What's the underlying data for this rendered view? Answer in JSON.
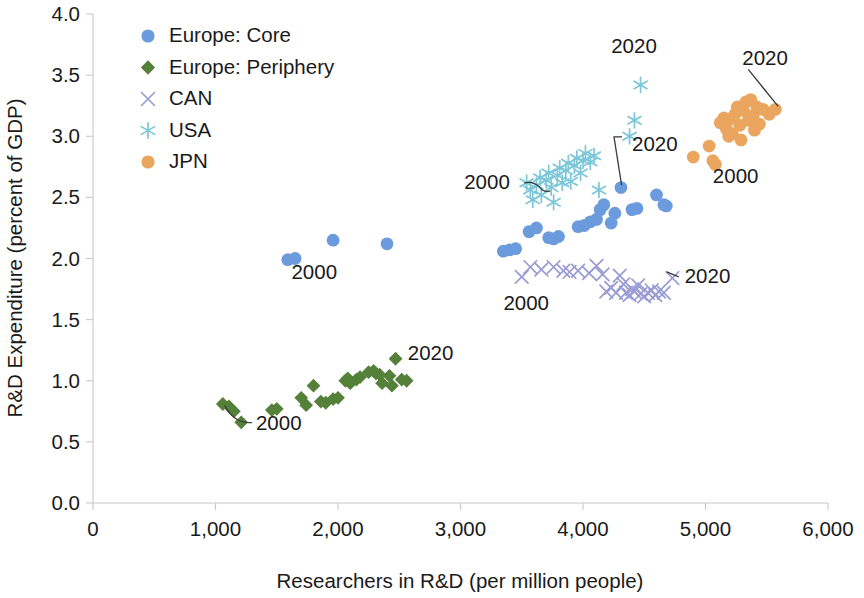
{
  "chart_data": {
    "type": "scatter",
    "title": "",
    "xlabel": "Researchers in R&D (per million people)",
    "ylabel": "R&D Expenditure (percent of GDP)",
    "xlim": [
      0,
      6000
    ],
    "ylim": [
      0,
      4.0
    ],
    "xticks": [
      0,
      1000,
      2000,
      3000,
      4000,
      5000,
      6000
    ],
    "xtick_labels": [
      "0",
      "1,000",
      "2,000",
      "3,000",
      "4,000",
      "5,000",
      "6,000"
    ],
    "yticks": [
      0.0,
      0.5,
      1.0,
      1.5,
      2.0,
      2.5,
      3.0,
      3.5,
      4.0
    ],
    "ytick_labels": [
      "0.0",
      "0.5",
      "1.0",
      "1.5",
      "2.0",
      "2.5",
      "3.0",
      "3.5",
      "4.0"
    ],
    "grid": false,
    "legend_position": "top-left",
    "series": [
      {
        "name": "Europe: Core",
        "color": "#6c9bdd",
        "marker": "circle",
        "points": [
          [
            1590,
            1.99
          ],
          [
            1650,
            2.0
          ],
          [
            1960,
            2.15
          ],
          [
            2400,
            2.12
          ],
          [
            3350,
            2.06
          ],
          [
            3400,
            2.07
          ],
          [
            3450,
            2.08
          ],
          [
            3560,
            2.22
          ],
          [
            3620,
            2.25
          ],
          [
            3720,
            2.17
          ],
          [
            3760,
            2.16
          ],
          [
            3800,
            2.18
          ],
          [
            3960,
            2.26
          ],
          [
            4010,
            2.27
          ],
          [
            4060,
            2.3
          ],
          [
            4110,
            2.32
          ],
          [
            4140,
            2.4
          ],
          [
            4170,
            2.44
          ],
          [
            4230,
            2.29
          ],
          [
            4260,
            2.37
          ],
          [
            4310,
            2.58
          ],
          [
            4400,
            2.4
          ],
          [
            4440,
            2.41
          ],
          [
            4600,
            2.52
          ],
          [
            4660,
            2.44
          ],
          [
            4680,
            2.43
          ]
        ]
      },
      {
        "name": "Europe: Periphery",
        "color": "#54803a",
        "marker": "diamond",
        "points": [
          [
            1060,
            0.81
          ],
          [
            1110,
            0.79
          ],
          [
            1150,
            0.75
          ],
          [
            1210,
            0.66
          ],
          [
            1460,
            0.76
          ],
          [
            1500,
            0.77
          ],
          [
            1700,
            0.86
          ],
          [
            1740,
            0.8
          ],
          [
            1800,
            0.96
          ],
          [
            1860,
            0.83
          ],
          [
            1900,
            0.82
          ],
          [
            1960,
            0.85
          ],
          [
            2000,
            0.86
          ],
          [
            2060,
            1.0
          ],
          [
            2080,
            1.02
          ],
          [
            2100,
            0.98
          ],
          [
            2150,
            1.01
          ],
          [
            2180,
            1.03
          ],
          [
            2250,
            1.07
          ],
          [
            2290,
            1.08
          ],
          [
            2310,
            1.06
          ],
          [
            2340,
            1.05
          ],
          [
            2360,
            0.98
          ],
          [
            2420,
            1.04
          ],
          [
            2440,
            0.96
          ],
          [
            2470,
            1.18
          ],
          [
            2520,
            1.01
          ],
          [
            2560,
            1.0
          ]
        ]
      },
      {
        "name": "CAN",
        "color": "#9a9bd4",
        "marker": "x",
        "points": [
          [
            3500,
            1.85
          ],
          [
            3570,
            1.93
          ],
          [
            3660,
            1.91
          ],
          [
            3760,
            1.93
          ],
          [
            3840,
            1.9
          ],
          [
            3890,
            1.89
          ],
          [
            3960,
            1.9
          ],
          [
            4050,
            1.88
          ],
          [
            4110,
            1.94
          ],
          [
            4160,
            1.87
          ],
          [
            4190,
            1.73
          ],
          [
            4230,
            1.76
          ],
          [
            4270,
            1.72
          ],
          [
            4300,
            1.86
          ],
          [
            4330,
            1.79
          ],
          [
            4350,
            1.72
          ],
          [
            4380,
            1.7
          ],
          [
            4400,
            1.75
          ],
          [
            4420,
            1.73
          ],
          [
            4450,
            1.78
          ],
          [
            4470,
            1.71
          ],
          [
            4500,
            1.69
          ],
          [
            4530,
            1.72
          ],
          [
            4560,
            1.74
          ],
          [
            4590,
            1.7
          ],
          [
            4620,
            1.73
          ],
          [
            4660,
            1.72
          ],
          [
            4730,
            1.84
          ]
        ]
      },
      {
        "name": "USA",
        "color": "#7cc6d9",
        "marker": "asterisk",
        "points": [
          [
            3540,
            2.62
          ],
          [
            3570,
            2.56
          ],
          [
            3590,
            2.48
          ],
          [
            3620,
            2.6
          ],
          [
            3650,
            2.66
          ],
          [
            3660,
            2.52
          ],
          [
            3700,
            2.64
          ],
          [
            3720,
            2.7
          ],
          [
            3740,
            2.58
          ],
          [
            3760,
            2.46
          ],
          [
            3790,
            2.68
          ],
          [
            3810,
            2.74
          ],
          [
            3830,
            2.62
          ],
          [
            3860,
            2.72
          ],
          [
            3880,
            2.78
          ],
          [
            3900,
            2.63
          ],
          [
            3930,
            2.76
          ],
          [
            3950,
            2.82
          ],
          [
            3980,
            2.7
          ],
          [
            4000,
            2.8
          ],
          [
            4020,
            2.86
          ],
          [
            4060,
            2.79
          ],
          [
            4090,
            2.84
          ],
          [
            4130,
            2.56
          ],
          [
            4380,
            3.0
          ],
          [
            4420,
            3.13
          ],
          [
            4470,
            3.42
          ]
        ]
      },
      {
        "name": "JPN",
        "color": "#eaa55f",
        "marker": "circle",
        "points": [
          [
            4900,
            2.83
          ],
          [
            5030,
            2.92
          ],
          [
            5060,
            2.8
          ],
          [
            5080,
            2.77
          ],
          [
            5120,
            3.11
          ],
          [
            5150,
            3.15
          ],
          [
            5170,
            3.06
          ],
          [
            5190,
            3.0
          ],
          [
            5200,
            3.14
          ],
          [
            5220,
            3.02
          ],
          [
            5240,
            3.18
          ],
          [
            5260,
            3.24
          ],
          [
            5280,
            3.09
          ],
          [
            5290,
            2.97
          ],
          [
            5310,
            3.21
          ],
          [
            5330,
            3.28
          ],
          [
            5350,
            3.13
          ],
          [
            5370,
            3.3
          ],
          [
            5390,
            3.17
          ],
          [
            5400,
            3.05
          ],
          [
            5420,
            3.24
          ],
          [
            5440,
            3.1
          ],
          [
            5470,
            3.22
          ],
          [
            5520,
            3.18
          ],
          [
            5570,
            3.22
          ]
        ]
      }
    ],
    "annotations": [
      {
        "label": "2000",
        "series": "Europe: Periphery",
        "x": 1330,
        "y": 0.6,
        "anchor": "start",
        "leader": "curve-left-up",
        "target_x": 1075,
        "target_y": 0.8
      },
      {
        "label": "2020",
        "series": "Europe: Periphery",
        "x": 2570,
        "y": 1.17,
        "anchor": "start",
        "leader": "none",
        "target_x": 2480,
        "target_y": 1.18
      },
      {
        "label": "2000",
        "series": "Europe: Core",
        "x": 1620,
        "y": 1.83,
        "anchor": "start",
        "leader": "none",
        "target_x": 1620,
        "target_y": 1.99
      },
      {
        "label": "2020",
        "series": "Europe: Core",
        "x": 4400,
        "y": 2.88,
        "anchor": "start",
        "leader": "elbow-down-left",
        "target_x": 4315,
        "target_y": 2.6
      },
      {
        "label": "2000",
        "series": "USA",
        "x": 3030,
        "y": 2.57,
        "anchor": "start",
        "leader": "hook-right",
        "target_x": 3520,
        "target_y": 2.58
      },
      {
        "label": "2020",
        "series": "USA",
        "x": 4230,
        "y": 3.68,
        "anchor": "start",
        "leader": "none",
        "target_x": 4470,
        "target_y": 3.42
      },
      {
        "label": "2000",
        "series": "CAN",
        "x": 3350,
        "y": 1.58,
        "anchor": "start",
        "leader": "none",
        "target_x": 3500,
        "target_y": 1.85
      },
      {
        "label": "2020",
        "series": "CAN",
        "x": 4830,
        "y": 1.8,
        "anchor": "start",
        "leader": "tick-left",
        "target_x": 4740,
        "target_y": 1.84
      },
      {
        "label": "2000",
        "series": "JPN",
        "x": 5060,
        "y": 2.62,
        "anchor": "start",
        "leader": "none",
        "target_x": 4990,
        "target_y": 2.8
      },
      {
        "label": "2020",
        "series": "JPN",
        "x": 5300,
        "y": 3.58,
        "anchor": "start",
        "leader": "diag-down-left",
        "target_x": 5560,
        "target_y": 3.22
      }
    ]
  },
  "legend": {
    "items": [
      {
        "label": "Europe: Core",
        "color": "#6c9bdd",
        "marker": "circle"
      },
      {
        "label": "Europe: Periphery",
        "color": "#54803a",
        "marker": "diamond"
      },
      {
        "label": "CAN",
        "color": "#9a9bd4",
        "marker": "x"
      },
      {
        "label": "USA",
        "color": "#7cc6d9",
        "marker": "asterisk"
      },
      {
        "label": "JPN",
        "color": "#eaa55f",
        "marker": "circle"
      }
    ]
  }
}
